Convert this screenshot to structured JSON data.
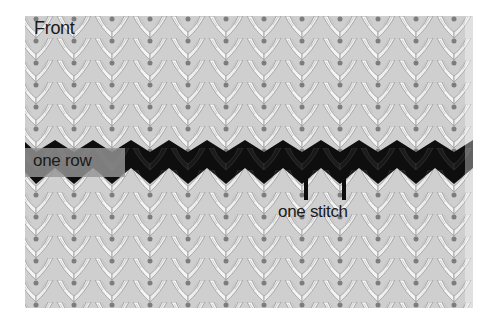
{
  "figure": {
    "title": "Front",
    "annotations": {
      "row_label": "one row",
      "stitch_label": "one stitch"
    },
    "colors": {
      "yarn_main": "#f2f2f2",
      "yarn_shadow": "#8a8a8a",
      "contrast_row": "#111111",
      "label_box": "#969696"
    }
  }
}
